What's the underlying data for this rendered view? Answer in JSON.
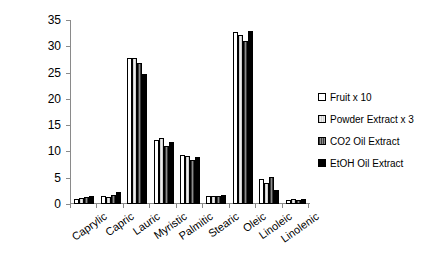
{
  "chart_data": {
    "type": "bar",
    "title": "",
    "xlabel": "",
    "ylabel": "Content %",
    "ylim": [
      0,
      35
    ],
    "yticks": [
      0,
      5,
      10,
      15,
      20,
      25,
      30,
      35
    ],
    "grid": false,
    "legend_position": "right",
    "categories": [
      "Caprylic",
      "Capric",
      "Lauric",
      "Myristic",
      "Palmitic",
      "Stearic",
      "Oleic",
      "Linoleic",
      "Linolenic"
    ],
    "series": [
      {
        "name": "Fruit x 10",
        "swatch": "#ffffff",
        "values": [
          1.0,
          1.5,
          27.8,
          12.2,
          9.4,
          1.5,
          32.8,
          4.8,
          0.8
        ]
      },
      {
        "name": "Powder Extract x 3",
        "swatch": "#d8d8d8",
        "values": [
          1.2,
          1.4,
          27.8,
          12.5,
          9.1,
          1.6,
          32.2,
          4.0,
          0.9
        ]
      },
      {
        "name": "CO2 Oil Extract",
        "swatch": "#555555",
        "values": [
          1.4,
          1.7,
          26.8,
          11.0,
          8.3,
          1.6,
          31.0,
          5.2,
          0.7
        ]
      },
      {
        "name": "EtOH Oil Extract",
        "swatch": "#000000",
        "values": [
          1.5,
          2.2,
          24.8,
          11.8,
          9.0,
          1.8,
          33.0,
          2.6,
          0.9
        ]
      }
    ]
  }
}
